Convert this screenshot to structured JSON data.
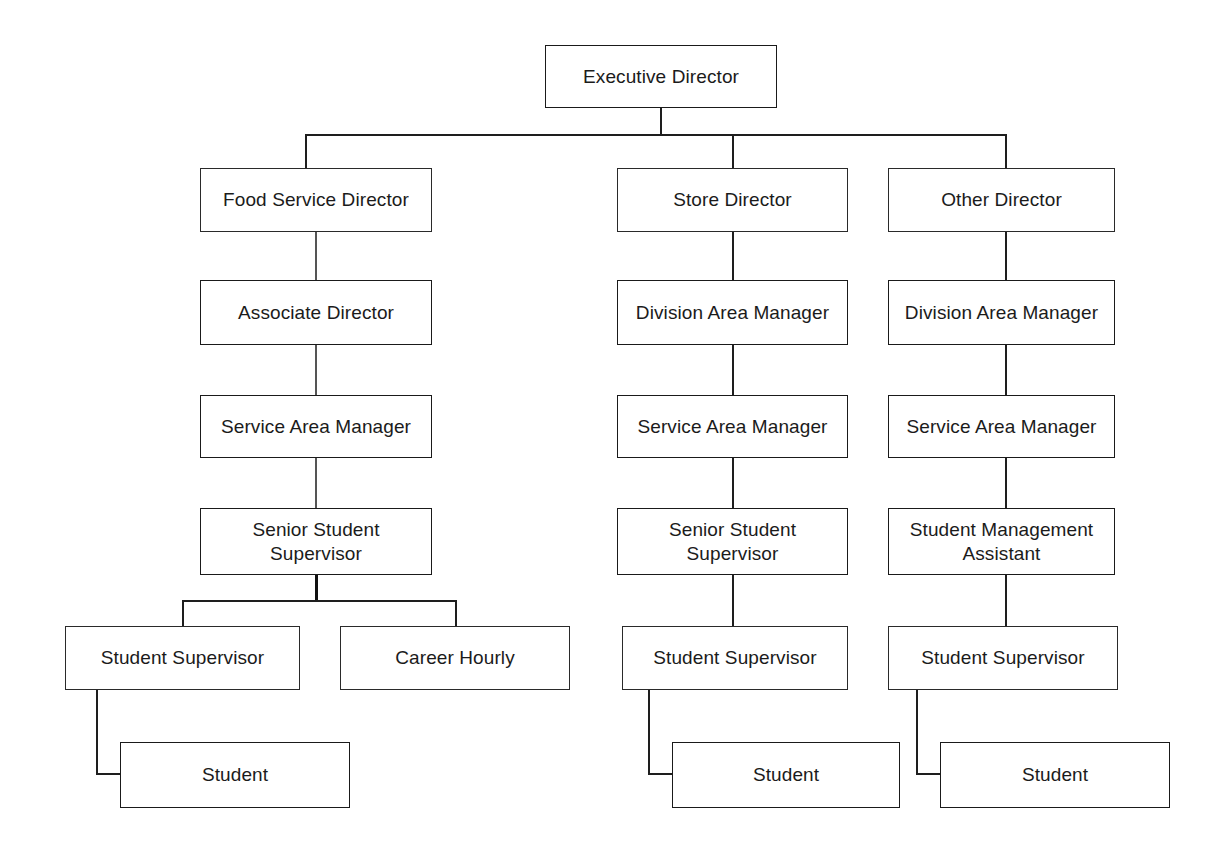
{
  "diagram": {
    "type": "organizational-chart",
    "nodes": [
      {
        "id": "executive-director",
        "label": "Executive Director",
        "level": 0,
        "column": "center"
      },
      {
        "id": "food-service-director",
        "label": "Food Service Director",
        "level": 1,
        "column": "left",
        "parent": "executive-director"
      },
      {
        "id": "store-director",
        "label": "Store Director",
        "level": 1,
        "column": "middle",
        "parent": "executive-director"
      },
      {
        "id": "other-director",
        "label": "Other Director",
        "level": 1,
        "column": "right",
        "parent": "executive-director"
      },
      {
        "id": "associate-director",
        "label": "Associate Director",
        "level": 2,
        "column": "left",
        "parent": "food-service-director"
      },
      {
        "id": "division-area-manager-mid",
        "label": "Division Area Manager",
        "level": 2,
        "column": "middle",
        "parent": "store-director"
      },
      {
        "id": "division-area-manager-rt",
        "label": "Division Area Manager",
        "level": 2,
        "column": "right",
        "parent": "other-director"
      },
      {
        "id": "service-area-manager-left",
        "label": "Service Area Manager",
        "level": 3,
        "column": "left",
        "parent": "associate-director"
      },
      {
        "id": "service-area-manager-mid",
        "label": "Service Area Manager",
        "level": 3,
        "column": "middle",
        "parent": "division-area-manager-mid"
      },
      {
        "id": "service-area-manager-rt",
        "label": "Service Area Manager",
        "level": 3,
        "column": "right",
        "parent": "division-area-manager-rt"
      },
      {
        "id": "senior-student-supervisor-left",
        "label": "Senior Student\nSupervisor",
        "level": 4,
        "column": "left",
        "parent": "service-area-manager-left"
      },
      {
        "id": "senior-student-supervisor-mid",
        "label": "Senior Student\nSupervisor",
        "level": 4,
        "column": "middle",
        "parent": "service-area-manager-mid"
      },
      {
        "id": "student-management-assistant",
        "label": "Student Management\nAssistant",
        "level": 4,
        "column": "right",
        "parent": "service-area-manager-rt"
      },
      {
        "id": "student-supervisor-left",
        "label": "Student Supervisor",
        "level": 5,
        "column": "left",
        "parent": "senior-student-supervisor-left"
      },
      {
        "id": "career-hourly",
        "label": "Career Hourly",
        "level": 5,
        "column": "left",
        "parent": "senior-student-supervisor-left"
      },
      {
        "id": "student-supervisor-mid",
        "label": "Student Supervisor",
        "level": 5,
        "column": "middle",
        "parent": "senior-student-supervisor-mid"
      },
      {
        "id": "student-supervisor-rt",
        "label": "Student Supervisor",
        "level": 5,
        "column": "right",
        "parent": "student-management-assistant"
      },
      {
        "id": "student-left",
        "label": "Student",
        "level": 6,
        "column": "left",
        "parent": "student-supervisor-left"
      },
      {
        "id": "student-mid",
        "label": "Student",
        "level": 6,
        "column": "middle",
        "parent": "student-supervisor-mid"
      },
      {
        "id": "student-rt",
        "label": "Student",
        "level": 6,
        "column": "right",
        "parent": "student-supervisor-rt"
      }
    ],
    "levels": [
      "Executive",
      "Director",
      "Manager",
      "Service Area Manager",
      "Senior Supervisor",
      "Supervisor",
      "Student"
    ],
    "colors": {
      "box_border": "#1a1a1a",
      "box_fill": "#ffffff",
      "connector": "#1e1e1e",
      "text": "#1b1b1b",
      "background": "#ffffff"
    }
  }
}
